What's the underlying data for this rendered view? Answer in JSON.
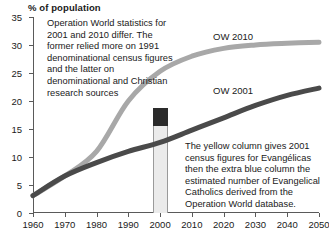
{
  "chart_data": {
    "type": "line",
    "title": "% of population",
    "xlabel": "",
    "ylabel": "% of population",
    "xlim": [
      1960,
      2050
    ],
    "ylim": [
      0,
      35
    ],
    "grid": false,
    "legend_position": "inline-labels",
    "x_ticks": [
      1960,
      1970,
      1980,
      1990,
      2000,
      2010,
      2020,
      2030,
      2040,
      2050
    ],
    "y_ticks": [
      0,
      5,
      10,
      15,
      20,
      25,
      30,
      35
    ],
    "x": [
      1960,
      1970,
      1980,
      1990,
      2000,
      2010,
      2020,
      2030,
      2040,
      2050
    ],
    "series": [
      {
        "name": "OW 2010",
        "color": "#a8a8a8",
        "values": [
          3.1,
          6.6,
          11.0,
          20.0,
          25.3,
          28.0,
          29.4,
          30.0,
          30.3,
          30.5
        ]
      },
      {
        "name": "OW 2001",
        "color": "#4a4a4a",
        "values": [
          3.1,
          6.6,
          9.0,
          11.0,
          12.6,
          14.8,
          17.0,
          19.2,
          21.0,
          22.3
        ]
      }
    ],
    "columns": [
      {
        "name": "2001 census Evangélicas",
        "x": 2000,
        "y0": 0,
        "y1": 15.5,
        "color": "#ebebeb"
      },
      {
        "name": "Estimated Evangelical Catholics",
        "x": 2000,
        "y0": 15.5,
        "y1": 18.7,
        "color": "#2b2b2b"
      }
    ],
    "annotations": [
      {
        "name": "top-left-note",
        "text": "Operation World statistics for 2001 and 2010 differ. The former relied more on 1991 denominational census figures and the latter on denominational and Christian research sources"
      },
      {
        "name": "bottom-right-note",
        "text": "The yellow column gives 2001 census figures for Evangélicas then the extra blue column the estimated number of Evangelical Catholics derived from the Operation World database."
      }
    ],
    "series_labels": [
      "OW 2010",
      "OW 2001"
    ]
  },
  "labels": {
    "axis_title": "% of population",
    "note_top_left": "Operation World statistics for 2001 and 2010 differ. The former relied more on 1991 denominational census figures and the latter on denominational and Christian research sources",
    "note_bottom_right": "The yellow column gives 2001 census figures for Evangélicas then the extra blue column the estimated number of Evangelical Catholics derived from the Operation World database.",
    "label_ow_2010": "OW 2010",
    "label_ow_2001": "OW 2001"
  },
  "colors": {
    "ow_2010": "#a8a8a8",
    "ow_2001": "#4a4a4a",
    "column_light": "#ebebeb",
    "column_dark": "#2b2b2b",
    "axis": "#5a5a5a",
    "text": "#1a1a1a",
    "background": "#ffffff"
  }
}
